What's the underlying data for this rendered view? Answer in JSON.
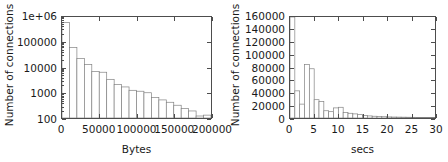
{
  "figure": {
    "title": "",
    "panels": [
      "left",
      "right"
    ]
  },
  "chart_data": [
    {
      "id": "bytes-histogram",
      "type": "bar",
      "title": "",
      "subtitle": "",
      "xlabel": "Bytes",
      "ylabel": "Number of connections",
      "yscale": "log",
      "xscale": "linear",
      "xlim": [
        0,
        200000
      ],
      "ylim": [
        100,
        1000000
      ],
      "grid": false,
      "legend": false,
      "xticks": [
        "0",
        "50000",
        "100000",
        "150000",
        "200000"
      ],
      "xtick_values": [
        0,
        50000,
        100000,
        150000,
        200000
      ],
      "yticks": [
        "100",
        "1000",
        "10000",
        "100000",
        "1e+06"
      ],
      "ytick_values": [
        100,
        1000,
        10000,
        100000,
        1000000
      ],
      "bin_width": 10000,
      "bin_starts": [
        0,
        10000,
        20000,
        30000,
        40000,
        50000,
        60000,
        70000,
        80000,
        90000,
        100000,
        110000,
        120000,
        130000,
        140000,
        150000,
        160000,
        170000,
        180000,
        190000
      ],
      "categories": [
        "0-10k",
        "10k-20k",
        "20k-30k",
        "30k-40k",
        "40k-50k",
        "50k-60k",
        "60k-70k",
        "70k-80k",
        "80k-90k",
        "90k-100k",
        "100k-110k",
        "110k-120k",
        "120k-130k",
        "130k-140k",
        "140k-150k",
        "150k-160k",
        "160k-170k",
        "170k-180k",
        "180k-190k",
        "190k-200k"
      ],
      "values": [
        600000,
        62000,
        23000,
        13000,
        7000,
        6500,
        3400,
        2100,
        1700,
        1250,
        1150,
        1000,
        640,
        520,
        420,
        320,
        240,
        190,
        120,
        130
      ]
    },
    {
      "id": "secs-histogram",
      "type": "bar",
      "title": "",
      "subtitle": "",
      "xlabel": "secs",
      "ylabel": "Number of connections",
      "yscale": "linear",
      "xscale": "linear",
      "xlim": [
        0,
        30
      ],
      "ylim": [
        0,
        160000
      ],
      "grid": false,
      "legend": false,
      "xticks": [
        "0",
        "5",
        "10",
        "15",
        "20",
        "25",
        "30"
      ],
      "xtick_values": [
        0,
        5,
        10,
        15,
        20,
        25,
        30
      ],
      "yticks": [
        "0",
        "20000",
        "40000",
        "60000",
        "80000",
        "100000",
        "120000",
        "140000",
        "160000"
      ],
      "ytick_values": [
        0,
        20000,
        40000,
        60000,
        80000,
        100000,
        120000,
        140000,
        160000
      ],
      "bin_width": 1,
      "bin_starts": [
        0,
        1,
        2,
        3,
        4,
        5,
        6,
        7,
        8,
        9,
        10,
        11,
        12,
        13,
        14,
        15,
        16,
        17,
        18,
        19,
        20,
        21,
        22,
        23,
        24,
        25,
        26,
        27,
        28,
        29
      ],
      "categories": [
        "0-1",
        "1-2",
        "2-3",
        "3-4",
        "4-5",
        "5-6",
        "6-7",
        "7-8",
        "8-9",
        "9-10",
        "10-11",
        "11-12",
        "12-13",
        "13-14",
        "14-15",
        "15-16",
        "16-17",
        "17-18",
        "18-19",
        "19-20",
        "20-21",
        "21-22",
        "22-23",
        "23-24",
        "24-25",
        "25-26",
        "26-27",
        "27-28",
        "28-29",
        "29-30"
      ],
      "values": [
        163000,
        43000,
        22000,
        85000,
        78000,
        29000,
        26000,
        11500,
        10000,
        16000,
        17000,
        8500,
        7500,
        6500,
        5500,
        4200,
        3300,
        2800,
        2400,
        2000,
        1700,
        1500,
        1400,
        1300,
        1200,
        1100,
        1000,
        950,
        900,
        850
      ],
      "notes": "first bar is clipped by the top of the axis range"
    }
  ],
  "style": {
    "axis_color": "#4d4d4d",
    "bar_edge_color": "#808080",
    "bar_fill_color": "#ffffff",
    "text_color": "#1a1a1a",
    "background": "#ffffff"
  }
}
